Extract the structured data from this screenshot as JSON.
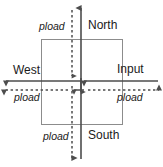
{
  "diagram": {
    "colors": {
      "stroke": "#4d4d4d",
      "box_stroke": "#808080",
      "text": "#1a1a1a",
      "background": "#ffffff"
    },
    "labels": {
      "pload_north": "pload",
      "north": "North",
      "west": "West",
      "input": "Input",
      "pload_west": "pload",
      "pload_east": "pload",
      "pload_south": "pload",
      "south": "South"
    },
    "elements": {
      "center_box": "rectangle",
      "vertical_solid_axis": "North-South solid arrow",
      "vertical_dashed_axis": "pload dashed arrow (vertical)",
      "horizontal_solid_axis": "West-Input solid arrow",
      "horizontal_dashed_axis": "pload dashed arrow (horizontal)"
    }
  }
}
